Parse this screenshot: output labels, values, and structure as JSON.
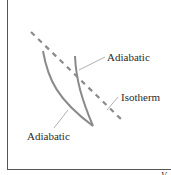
{
  "diagram": {
    "type": "pV-diagram",
    "labels": {
      "adiabatic_upper": "Adiabatic",
      "isotherm": "Isotherm",
      "adiabatic_lower": "Adiabatic",
      "x_axis": "V"
    },
    "colors": {
      "curve": "#8a8a8a",
      "axis": "#555555",
      "text": "#2a2a2a",
      "leader": "#9a9a9a"
    }
  }
}
